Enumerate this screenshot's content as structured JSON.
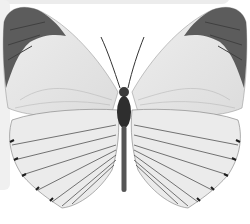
{
  "image": {
    "subject": "butterfly",
    "description": "White butterfly with dark grey forewing tips, dorsal view, on white background",
    "colors": {
      "background": "#ffffff",
      "wing": "#e6e6e6",
      "wing_tip": "#5a5a5a",
      "vein": "#3a3a3a",
      "body": "#2e2e2e",
      "backdrop_panel": "#ececec"
    }
  }
}
